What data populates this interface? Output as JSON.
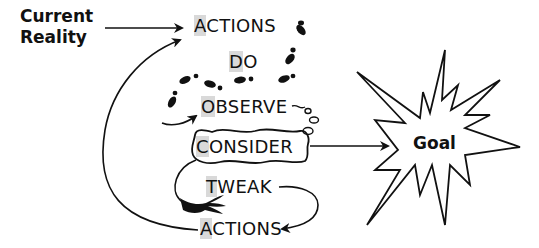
{
  "diagram": {
    "start_label_line1": "Current",
    "start_label_line2": "Reality",
    "steps": [
      {
        "first": "A",
        "rest": "CTIONS"
      },
      {
        "first": "D",
        "rest": "O"
      },
      {
        "first": "O",
        "rest": "BSERVE"
      },
      {
        "first": "C",
        "rest": "ONSIDER"
      },
      {
        "first": "T",
        "rest": "WEAK"
      },
      {
        "first": "A",
        "rest": "CTIONS"
      }
    ],
    "goal_label": "Goal",
    "icons": [
      "footprints-icon",
      "thought-bubble-icon",
      "hand-icon",
      "starburst-icon",
      "arrow-icon"
    ],
    "colors": {
      "ink": "#111111",
      "highlight": "#d9d9d9",
      "background": "#ffffff"
    }
  }
}
